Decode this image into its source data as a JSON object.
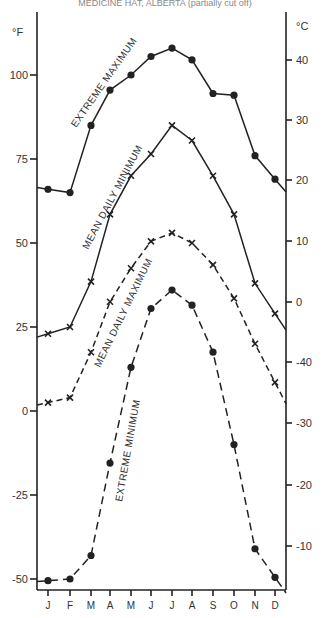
{
  "title": "MEDICINE HAT, ALBERTA (partially cut off)",
  "axes": {
    "left_unit": "°F",
    "right_unit": "°C",
    "left_ticks": [
      "100",
      "75",
      "50",
      "25",
      "0",
      "-25",
      "-50"
    ],
    "right_ticks": [
      "40",
      "30",
      "20",
      "10",
      "0",
      "-40",
      "-30",
      "-20",
      "-10"
    ],
    "months": [
      "J",
      "F",
      "M",
      "A",
      "M",
      "J",
      "J",
      "A",
      "S",
      "O",
      "N",
      "D"
    ]
  },
  "curve_labels": {
    "extreme_max": "EXTREME  MAXIMUM",
    "mean_upper": "MEAN DAILY  MINIMUM",
    "mean_lower": "MEAN DAILY  MAXIMUM",
    "extreme_min": "EXTREME  MINIMUM"
  },
  "chart_data": {
    "type": "line",
    "title": "",
    "xlabel": "",
    "ylabel": "°F",
    "ylabel_right": "°C",
    "categories": [
      "J",
      "F",
      "M",
      "A",
      "M",
      "J",
      "J",
      "A",
      "S",
      "O",
      "N",
      "D"
    ],
    "ylim": [
      -52,
      110
    ],
    "grid": false,
    "series": [
      {
        "name": "EXTREME MAXIMUM",
        "marker": "dot",
        "line": "solid",
        "values": [
          66,
          65,
          85,
          95.5,
          100,
          105.5,
          108,
          104.5,
          94.5,
          94,
          76,
          69
        ]
      },
      {
        "name": "MEAN DAILY MINIMUM (as labeled; upper x-curve)",
        "marker": "x",
        "line": "solid",
        "values": [
          23,
          25,
          38.5,
          58.5,
          70,
          76.5,
          85,
          80.5,
          70,
          58.5,
          38,
          29
        ]
      },
      {
        "name": "MEAN DAILY MAXIMUM (as labeled; lower x-curve)",
        "marker": "x",
        "line": "dashed",
        "values": [
          2.5,
          4,
          17.5,
          32.5,
          42.5,
          50.5,
          53,
          50,
          43.5,
          33.5,
          20,
          8.5
        ]
      },
      {
        "name": "EXTREME MINIMUM",
        "marker": "dot",
        "line": "dashed",
        "values": [
          -50.5,
          -50,
          -43,
          -15.5,
          13,
          30.5,
          36,
          31.5,
          17.5,
          -10,
          -41,
          -49.5
        ]
      }
    ],
    "right_axis_ticks_printed": [
      40,
      30,
      20,
      10,
      0,
      -40,
      -30,
      -20,
      -10
    ]
  }
}
